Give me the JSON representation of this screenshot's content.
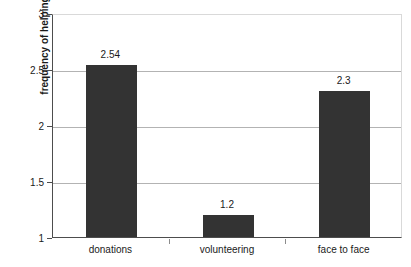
{
  "chart_data": {
    "type": "bar",
    "title": "",
    "xlabel": "",
    "ylabel": "frequency of helping",
    "categories": [
      "donations",
      "volunteering",
      "face to face"
    ],
    "values": [
      2.54,
      1.2,
      2.3
    ],
    "data_labels": [
      "2.54",
      "1.2",
      "2.3"
    ],
    "ylim": [
      1,
      3
    ],
    "yticks": [
      1,
      1.5,
      2,
      2.5,
      3
    ],
    "ytick_labels": [
      "1",
      "1.5",
      "2",
      "2.5",
      "3"
    ],
    "grid": true,
    "legend": "none",
    "bar_color": "#333333",
    "gridline_color": "#b3b3b3",
    "axis_color": "#4d4d4d",
    "background_color": "#ffffff"
  }
}
